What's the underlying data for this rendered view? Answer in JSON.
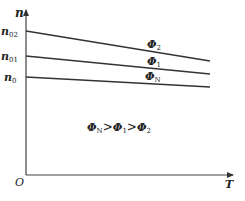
{
  "diagram": {
    "title": "",
    "axes": {
      "y_label": "n",
      "x_label": "T",
      "origin_label": "O"
    },
    "y_ticks": [
      {
        "base": "n",
        "sub": "02"
      },
      {
        "base": "n",
        "sub": "01"
      },
      {
        "base": "n",
        "sub": "0"
      }
    ],
    "curves": [
      {
        "base": "Φ",
        "sub": "2",
        "start_tick": "n02"
      },
      {
        "base": "Φ",
        "sub": "1",
        "start_tick": "n01"
      },
      {
        "base": "Φ",
        "sub": "N",
        "start_tick": "n0"
      }
    ],
    "annotation": {
      "phi_N": "Φ",
      "sub_N": "N",
      "gt1": ">",
      "phi_1": "Φ",
      "sub_1": "1",
      "gt2": ">",
      "phi_2": "Φ",
      "sub_2": "2"
    },
    "colors": {
      "line": "#333333",
      "text": "#222222"
    }
  }
}
